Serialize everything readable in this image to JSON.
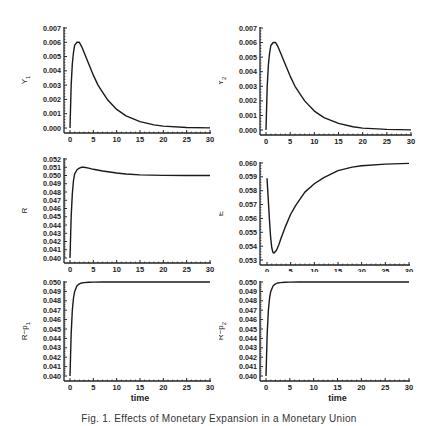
{
  "caption": "Fig. 1.  Effects of Monetary Expansion in a Monetary Union",
  "chart_data": [
    {
      "type": "line",
      "id": "Y1",
      "ylabel": "Y",
      "ylabel_sub": "1",
      "xlabel": "time",
      "xlim": [
        0,
        30
      ],
      "ylim": [
        0.0,
        0.007
      ],
      "xticks": [
        0,
        5,
        10,
        15,
        20,
        25,
        30
      ],
      "yticks": [
        "0.000",
        "0.001",
        "0.002",
        "0.003",
        "0.004",
        "0.005",
        "0.006",
        "0.007"
      ],
      "x": [
        0,
        0.25,
        0.5,
        0.75,
        1,
        1.5,
        2,
        2.5,
        3,
        4,
        5,
        6,
        7,
        8,
        10,
        12,
        15,
        18,
        20,
        25,
        30
      ],
      "y": [
        0.0,
        0.003,
        0.0045,
        0.0053,
        0.0058,
        0.006,
        0.006,
        0.0057,
        0.0053,
        0.0045,
        0.0037,
        0.003,
        0.0025,
        0.002,
        0.0013,
        0.00085,
        0.00045,
        0.00022,
        0.00013,
        4e-05,
        1e-05
      ]
    },
    {
      "type": "line",
      "id": "Y2",
      "ylabel": "Y",
      "ylabel_sub": "2",
      "xlabel": "time",
      "xlim": [
        0,
        30
      ],
      "ylim": [
        0.0,
        0.007
      ],
      "xticks": [
        0,
        5,
        10,
        15,
        20,
        25,
        30
      ],
      "yticks": [
        "0.000",
        "0.001",
        "0.002",
        "0.003",
        "0.004",
        "0.005",
        "0.006",
        "0.007"
      ],
      "x": [
        0,
        0.25,
        0.5,
        0.75,
        1,
        1.5,
        2,
        2.5,
        3,
        4,
        5,
        6,
        7,
        8,
        10,
        12,
        15,
        18,
        20,
        25,
        30
      ],
      "y": [
        0.0,
        0.003,
        0.0045,
        0.0053,
        0.0058,
        0.006,
        0.006,
        0.0057,
        0.0053,
        0.0045,
        0.0037,
        0.003,
        0.0025,
        0.002,
        0.0013,
        0.00085,
        0.00045,
        0.00022,
        0.00013,
        4e-05,
        1e-05
      ]
    },
    {
      "type": "line",
      "id": "R",
      "ylabel": "R",
      "ylabel_sub": "",
      "xlabel": "time",
      "xlim": [
        0,
        30
      ],
      "ylim": [
        0.04,
        0.052
      ],
      "xticks": [
        0,
        5,
        10,
        15,
        20,
        25,
        30
      ],
      "yticks": [
        "0.040",
        "0.041",
        "0.042",
        "0.043",
        "0.044",
        "0.045",
        "0.046",
        "0.047",
        "0.048",
        "0.049",
        "0.050",
        "0.051",
        "0.052"
      ],
      "x": [
        0,
        0.25,
        0.5,
        0.75,
        1,
        1.5,
        2,
        2.5,
        3,
        4,
        5,
        7,
        10,
        12,
        15,
        20,
        25,
        30
      ],
      "y": [
        0.04,
        0.045,
        0.0478,
        0.0494,
        0.0502,
        0.0507,
        0.0509,
        0.051,
        0.051,
        0.0509,
        0.05075,
        0.05055,
        0.0503,
        0.05018,
        0.05008,
        0.05002,
        0.05,
        0.05
      ]
    },
    {
      "type": "line",
      "id": "E",
      "ylabel": "E",
      "ylabel_sub": "",
      "xlabel": "time",
      "xlim": [
        0,
        30
      ],
      "ylim": [
        0.053,
        0.06
      ],
      "xticks": [
        0,
        5,
        10,
        15,
        20,
        25,
        30
      ],
      "yticks": [
        "0.053",
        "0.054",
        "0.055",
        "0.056",
        "0.057",
        "0.058",
        "0.059",
        "0.060"
      ],
      "x": [
        0,
        0.25,
        0.5,
        0.75,
        1,
        1.25,
        1.5,
        2,
        2.5,
        3,
        4,
        5,
        6,
        8,
        10,
        12,
        15,
        18,
        20,
        25,
        30
      ],
      "y": [
        0.0589,
        0.0575,
        0.056,
        0.0547,
        0.0539,
        0.05355,
        0.0535,
        0.0537,
        0.0541,
        0.0546,
        0.0555,
        0.0563,
        0.0569,
        0.0579,
        0.0585,
        0.05895,
        0.05945,
        0.0597,
        0.0598,
        0.05992,
        0.05997
      ]
    },
    {
      "type": "line",
      "id": "R-p1",
      "ylabel": "R−p",
      "ylabel_sub": "1",
      "ylabel_dot": true,
      "xlabel": "time",
      "xlim": [
        0,
        30
      ],
      "ylim": [
        0.04,
        0.05
      ],
      "xticks": [
        0,
        5,
        10,
        15,
        20,
        25,
        30
      ],
      "yticks": [
        "0.040",
        "0.041",
        "0.042",
        "0.043",
        "0.044",
        "0.045",
        "0.046",
        "0.047",
        "0.048",
        "0.049",
        "0.050"
      ],
      "x": [
        0,
        0.25,
        0.5,
        0.75,
        1,
        1.5,
        2,
        2.5,
        3,
        4,
        5,
        7,
        10,
        15,
        20,
        25,
        30
      ],
      "y": [
        0.04,
        0.0445,
        0.047,
        0.0483,
        0.049,
        0.0496,
        0.0498,
        0.0499,
        0.04993,
        0.04997,
        0.04999,
        0.05,
        0.05,
        0.05,
        0.05,
        0.05,
        0.05
      ]
    },
    {
      "type": "line",
      "id": "R-p2",
      "ylabel": "R−p",
      "ylabel_sub": "2",
      "ylabel_dot": true,
      "xlabel": "time",
      "xlim": [
        0,
        30
      ],
      "ylim": [
        0.04,
        0.05
      ],
      "xticks": [
        0,
        5,
        10,
        15,
        20,
        25,
        30
      ],
      "yticks": [
        "0.040",
        "0.041",
        "0.042",
        "0.043",
        "0.044",
        "0.045",
        "0.046",
        "0.047",
        "0.048",
        "0.049",
        "0.050"
      ],
      "x": [
        0,
        0.25,
        0.5,
        0.75,
        1,
        1.5,
        2,
        2.5,
        3,
        4,
        5,
        7,
        10,
        15,
        20,
        25,
        30
      ],
      "y": [
        0.04,
        0.0445,
        0.047,
        0.0483,
        0.049,
        0.0496,
        0.0498,
        0.0499,
        0.04993,
        0.04997,
        0.04999,
        0.05,
        0.05,
        0.05,
        0.05,
        0.05,
        0.05
      ]
    }
  ]
}
